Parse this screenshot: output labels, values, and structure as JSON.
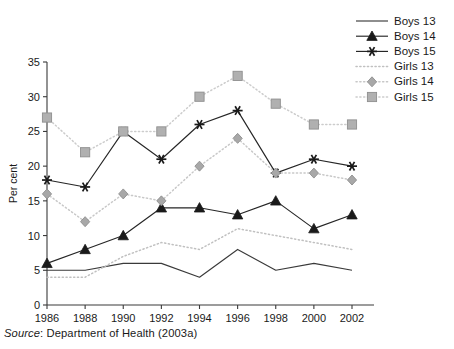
{
  "figure": {
    "source_label": "Source",
    "source_separator": ": ",
    "source_text": "Department of Health (2003a)",
    "clipped_title": ""
  },
  "chart_data": {
    "type": "line",
    "title": "",
    "xlabel": "",
    "ylabel": "Per cent",
    "x": [
      1986,
      1988,
      1990,
      1992,
      1994,
      1996,
      1998,
      2000,
      2002
    ],
    "categories": [
      "1986",
      "1988",
      "1990",
      "1992",
      "1994",
      "1996",
      "1998",
      "2000",
      "2002"
    ],
    "xticklabels": [
      "1986",
      "1988",
      "1990",
      "1992",
      "1994",
      "1996",
      "1998",
      "2000",
      "2002"
    ],
    "yticks": [
      0,
      5,
      10,
      15,
      20,
      25,
      30,
      35
    ],
    "yticklabels": [
      "0",
      "5",
      "10",
      "15",
      "20",
      "25",
      "30",
      "35"
    ],
    "ylim": [
      0,
      35
    ],
    "xlim": [
      1985,
      2003
    ],
    "grid": false,
    "legend_position": "top-right",
    "series": [
      {
        "name": "Boys 13",
        "label": "Boys 13",
        "values": [
          5,
          5,
          6,
          6,
          4,
          8,
          5,
          6,
          5
        ],
        "marker": "none",
        "linestyle": "solid",
        "color": "#3a3a3a",
        "marker_fill": "none"
      },
      {
        "name": "Boys 14",
        "label": "Boys 14",
        "values": [
          6,
          8,
          10,
          14,
          14,
          13,
          15,
          11,
          13
        ],
        "marker": "triangle",
        "linestyle": "solid",
        "color": "#262626",
        "marker_fill": "#1a1a1a"
      },
      {
        "name": "Boys 15",
        "label": "Boys 15",
        "values": [
          18,
          17,
          25,
          21,
          26,
          28,
          19,
          21,
          20
        ],
        "marker": "asterisk",
        "linestyle": "solid",
        "color": "#262626",
        "marker_fill": "#1a1a1a"
      },
      {
        "name": "Girls 13",
        "label": "Girls 13",
        "values": [
          4,
          4,
          7,
          9,
          8,
          11,
          10,
          9,
          8
        ],
        "marker": "none",
        "linestyle": "dotted",
        "color": "#c0c0c0",
        "marker_fill": "none"
      },
      {
        "name": "Girls 14",
        "label": "Girls 14",
        "values": [
          16,
          12,
          16,
          15,
          20,
          24,
          19,
          19,
          18
        ],
        "marker": "diamond",
        "linestyle": "dotted",
        "color": "#c8c8c8",
        "marker_fill": "#a8a8a8"
      },
      {
        "name": "Girls 15",
        "label": "Girls 15",
        "values": [
          27,
          22,
          25,
          25,
          30,
          33,
          29,
          26,
          26
        ],
        "marker": "square",
        "linestyle": "dotted",
        "color": "#cccccc",
        "marker_fill": "#b0b0b0"
      }
    ]
  }
}
